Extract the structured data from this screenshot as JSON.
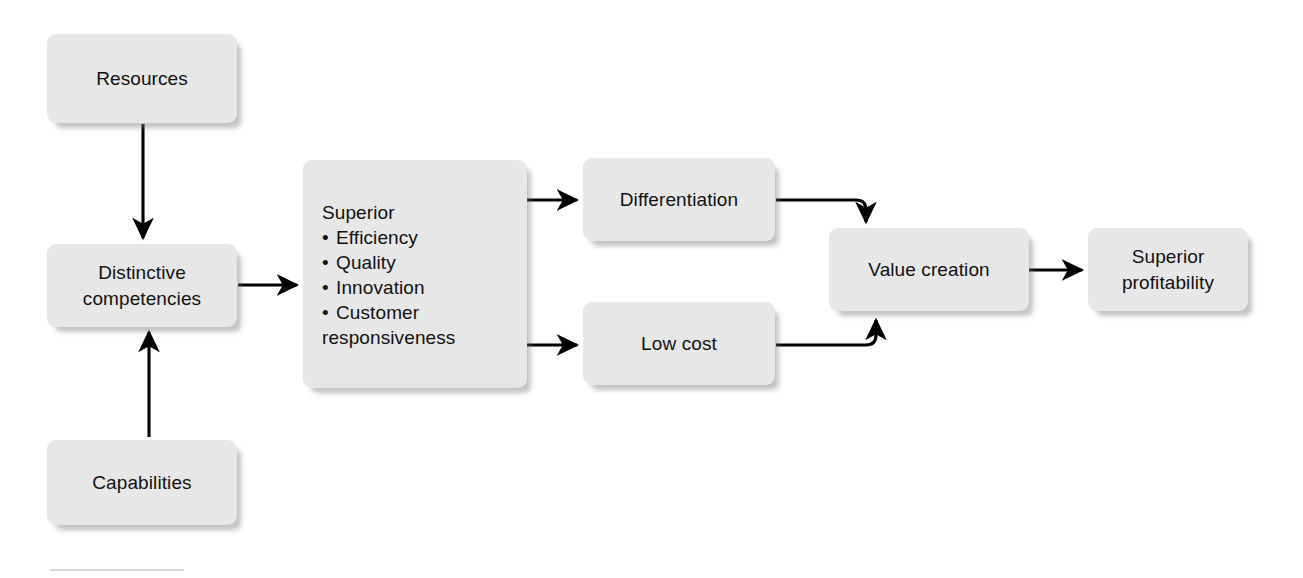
{
  "diagram": {
    "type": "flowchart",
    "background_color": "#ffffff",
    "node_fill_color": "#e7e7e7",
    "node_text_color": "#111111",
    "edge_color": "#000000",
    "nodes": {
      "resources": {
        "label": "Resources"
      },
      "capabilities": {
        "label": "Capabilities"
      },
      "distinctive_competencies": {
        "line1": "Distinctive",
        "line2": "competencies"
      },
      "superior": {
        "heading": "Superior",
        "items": [
          "Efficiency",
          "Quality",
          "Innovation",
          "Customer"
        ],
        "item_last_wrap": "responsiveness"
      },
      "differentiation": {
        "label": "Differentiation"
      },
      "low_cost": {
        "label": "Low cost"
      },
      "value_creation": {
        "label": "Value creation"
      },
      "superior_profitability": {
        "line1": "Superior",
        "line2": "profitability"
      }
    },
    "edges": [
      {
        "from": "resources",
        "to": "distinctive_competencies",
        "direction": "down"
      },
      {
        "from": "capabilities",
        "to": "distinctive_competencies",
        "direction": "up"
      },
      {
        "from": "distinctive_competencies",
        "to": "superior",
        "direction": "right"
      },
      {
        "from": "superior",
        "to": "differentiation",
        "direction": "right"
      },
      {
        "from": "superior",
        "to": "low_cost",
        "direction": "right"
      },
      {
        "from": "differentiation",
        "to": "value_creation",
        "direction": "right-down"
      },
      {
        "from": "low_cost",
        "to": "value_creation",
        "direction": "right-up"
      },
      {
        "from": "value_creation",
        "to": "superior_profitability",
        "direction": "right"
      }
    ]
  }
}
